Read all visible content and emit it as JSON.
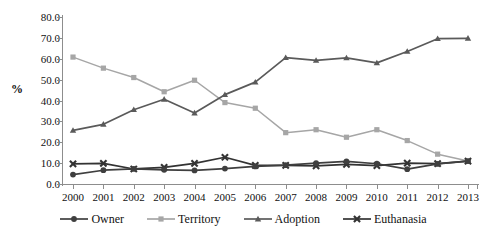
{
  "chart_data": {
    "type": "line",
    "title": "",
    "xlabel": "",
    "ylabel": "%",
    "ylim": [
      0,
      80
    ],
    "ytick_step": 10,
    "grid": false,
    "legend_position": "bottom",
    "categories": [
      "2000",
      "2001",
      "2002",
      "2003",
      "2004",
      "2005",
      "2006",
      "2007",
      "2008",
      "2009",
      "2010",
      "2011",
      "2012",
      "2013"
    ],
    "ytick_labels": [
      "0.0",
      "10.0",
      "20.0",
      "30.0",
      "40.0",
      "50.0",
      "60.0",
      "70.0",
      "80.0"
    ],
    "series": [
      {
        "name": "Owner",
        "color": "#3f3f3f",
        "marker": "circle",
        "values": [
          4.5,
          6.6,
          7.2,
          6.8,
          6.5,
          7.4,
          8.4,
          9.0,
          10.0,
          10.8,
          9.7,
          7.1,
          9.6,
          11.0
        ]
      },
      {
        "name": "Territory",
        "color": "#a6a6a6",
        "marker": "square",
        "values": [
          60.8,
          55.5,
          51.0,
          44.2,
          49.7,
          39.0,
          36.3,
          24.6,
          26.0,
          22.4,
          26.0,
          20.8,
          14.3,
          11.0
        ]
      },
      {
        "name": "Adoption",
        "color": "#5a5a5a",
        "marker": "triangle",
        "values": [
          25.7,
          28.6,
          35.6,
          40.6,
          34.0,
          42.8,
          48.8,
          60.5,
          59.2,
          60.4,
          58.0,
          63.5,
          69.6,
          69.8
        ]
      },
      {
        "name": "Euthanasia",
        "color": "#333333",
        "marker": "cross",
        "values": [
          9.6,
          9.9,
          7.2,
          8.0,
          9.9,
          12.8,
          8.9,
          8.9,
          8.7,
          9.4,
          8.8,
          10.0,
          9.8,
          11.0
        ]
      }
    ]
  },
  "legend": {
    "items": [
      {
        "label": "Owner"
      },
      {
        "label": "Territory"
      },
      {
        "label": "Adoption"
      },
      {
        "label": "Euthanasia"
      }
    ]
  }
}
